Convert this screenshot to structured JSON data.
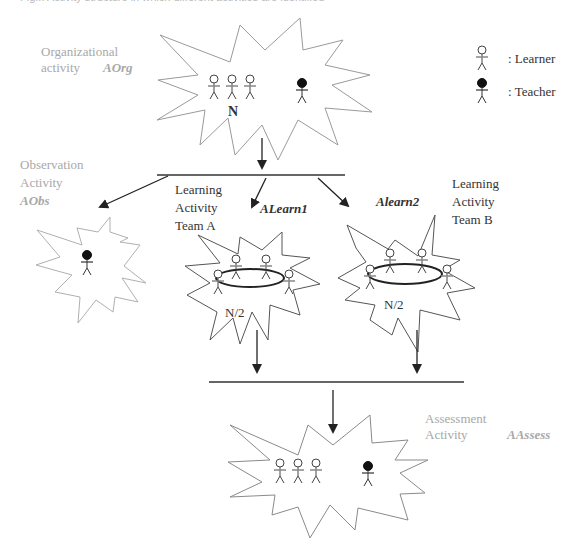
{
  "caption": "Fig... Activity structure in which different activities are identified",
  "legend": {
    "learner_label": ": Learner",
    "teacher_label": ": Teacher"
  },
  "activities": {
    "organizational": {
      "line1": "Organizational",
      "line2": "activity",
      "code": "AOrg",
      "count": "N"
    },
    "observation": {
      "line1": "Observation",
      "line2": "Activity",
      "code": "AObs"
    },
    "learn_a": {
      "line1": "Learning",
      "line2": "Activity",
      "line3": "Team A",
      "code": "ALearn1",
      "count": "N/2"
    },
    "learn_b": {
      "line1": "Learning",
      "line2": "Activity",
      "line3": "Team B",
      "code": "Alearn2",
      "count": "N/2"
    },
    "assessment": {
      "line1": "Assessment",
      "line2": "Activity",
      "code": "AAssess"
    }
  },
  "colors": {
    "burst_stroke": "#9a9a9a",
    "arrow": "#222222",
    "label_grey": "#a8a8a8",
    "label_dark": "#333333"
  }
}
